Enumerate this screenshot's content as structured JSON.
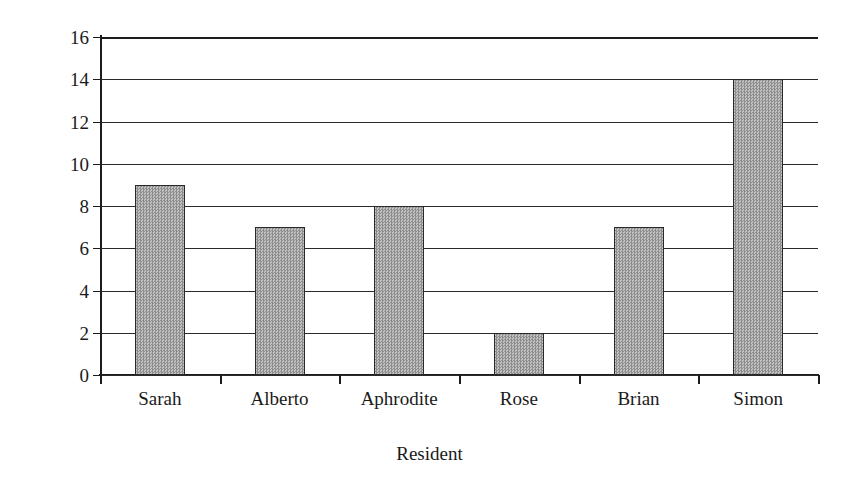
{
  "chart_data": {
    "type": "bar",
    "title": "",
    "categories": [
      "Sarah",
      "Alberto",
      "Aphrodite",
      "Rose",
      "Brian",
      "Simon"
    ],
    "values": [
      9,
      7,
      8,
      2,
      7,
      14
    ],
    "xlabel": "Resident",
    "ylabel": "Frequency",
    "ylim": [
      0,
      16
    ],
    "ytick_step": 2,
    "yticks": [
      0,
      2,
      4,
      6,
      8,
      10,
      12,
      14,
      16
    ],
    "ytick_labels": [
      "0",
      "2",
      "4",
      "6",
      "8",
      "10",
      "12",
      "14",
      "16"
    ],
    "grid": "horizontal",
    "legend": "none",
    "bar_color": "#9d9d9d",
    "bar_border_color": "#2a2a2a",
    "axis_color": "#1c1c1c",
    "background": "#ffffff"
  }
}
